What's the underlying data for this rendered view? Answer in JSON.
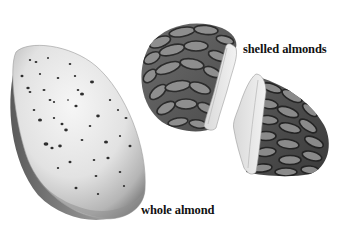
{
  "figure": {
    "labels": {
      "shelled": "shelled almonds",
      "whole": "whole almond"
    },
    "items": [
      {
        "name": "whole-almond",
        "description": "whole almond in pitted shell"
      },
      {
        "name": "shelled-almond-piece-1",
        "description": "broken shelled almond, left half"
      },
      {
        "name": "shelled-almond-piece-2",
        "description": "broken shelled almond, right half"
      }
    ],
    "colors": {
      "background": "#ffffff",
      "shell_light": "#ededed",
      "shell_shadow": "#6a6a6a",
      "kernel_skin": "#7a7a7a",
      "kernel_veins": "#2b2b2b",
      "kernel_flesh": "#e6e6e6",
      "text": "#111111"
    }
  }
}
